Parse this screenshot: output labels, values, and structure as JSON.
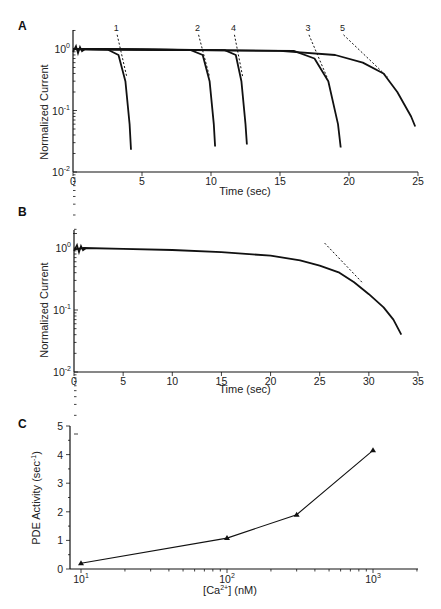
{
  "chart_data": [
    {
      "panel": "A",
      "type": "line",
      "xlabel": "Time (sec)",
      "ylabel": "Normalized Current",
      "xlim": [
        0,
        25
      ],
      "ylim": [
        0.01,
        2
      ],
      "yscale": "log",
      "xticks": [
        "0",
        "5",
        "10",
        "15",
        "20",
        "25"
      ],
      "yticks": [
        "10^0",
        "10^-1",
        "10^-2"
      ],
      "annotations": [
        "1",
        "2",
        "4",
        "3",
        "5"
      ],
      "series": [
        {
          "name": "1",
          "x": [
            0,
            2.5,
            3.3,
            3.8,
            4.1,
            4.2
          ],
          "y": [
            1.0,
            0.98,
            0.8,
            0.3,
            0.06,
            0.023
          ]
        },
        {
          "name": "2",
          "x": [
            0,
            8.5,
            9.4,
            9.9,
            10.2,
            10.3
          ],
          "y": [
            1.0,
            0.97,
            0.8,
            0.3,
            0.06,
            0.026
          ]
        },
        {
          "name": "4",
          "x": [
            0,
            11,
            11.8,
            12.2,
            12.5,
            12.6
          ],
          "y": [
            1.0,
            0.96,
            0.8,
            0.3,
            0.06,
            0.028
          ]
        },
        {
          "name": "3",
          "x": [
            0,
            16,
            17.5,
            18.5,
            19.2,
            19.4
          ],
          "y": [
            1.0,
            0.93,
            0.7,
            0.3,
            0.06,
            0.025
          ]
        },
        {
          "name": "5",
          "x": [
            0,
            15,
            19,
            21,
            22.5,
            23.5,
            24.5,
            24.8
          ],
          "y": [
            1.0,
            0.93,
            0.8,
            0.6,
            0.4,
            0.2,
            0.08,
            0.055
          ]
        }
      ],
      "fit_lines": [
        {
          "name": "1",
          "x": [
            3.2,
            3.9
          ],
          "y": [
            1.7,
            0.35
          ]
        },
        {
          "name": "2",
          "x": [
            9.1,
            9.9
          ],
          "y": [
            1.7,
            0.35
          ]
        },
        {
          "name": "4",
          "x": [
            11.7,
            12.3
          ],
          "y": [
            1.7,
            0.35
          ]
        },
        {
          "name": "3",
          "x": [
            17.1,
            18.4
          ],
          "y": [
            1.7,
            0.35
          ]
        },
        {
          "name": "5",
          "x": [
            19.6,
            22.8
          ],
          "y": [
            1.7,
            0.35
          ]
        }
      ]
    },
    {
      "panel": "B",
      "type": "line",
      "xlabel": "Time (sec)",
      "ylabel": "Normalized Current",
      "xlim": [
        0,
        35
      ],
      "ylim": [
        0.01,
        2
      ],
      "yscale": "log",
      "xticks": [
        "0",
        "5",
        "10",
        "15",
        "20",
        "25",
        "30",
        "35"
      ],
      "yticks": [
        "10^0",
        "10^-1",
        "10^-2"
      ],
      "series": [
        {
          "name": "trace",
          "x": [
            0,
            1,
            5,
            10,
            15,
            20,
            23,
            25,
            27,
            28.5,
            30,
            31.5,
            32.5,
            33.3
          ],
          "y": [
            0.95,
            1.0,
            0.97,
            0.93,
            0.86,
            0.75,
            0.63,
            0.52,
            0.4,
            0.28,
            0.18,
            0.11,
            0.07,
            0.04
          ]
        }
      ],
      "fit_lines": [
        {
          "name": "fit",
          "x": [
            25.5,
            29.3
          ],
          "y": [
            1.2,
            0.28
          ]
        }
      ]
    },
    {
      "panel": "C",
      "type": "line",
      "xlabel": "[Ca2+] (nM)",
      "ylabel": "PDE Activity (sec-1)",
      "xscale": "log",
      "xlim": [
        8,
        2000
      ],
      "ylim": [
        0,
        5
      ],
      "xticks": [
        "10^1",
        "10^2",
        "10^3"
      ],
      "yticks": [
        "0",
        "1",
        "2",
        "3",
        "4",
        "5"
      ],
      "marker": "triangle",
      "x": [
        10,
        100,
        300,
        1000
      ],
      "y": [
        0.2,
        1.08,
        1.9,
        4.15
      ]
    }
  ],
  "labels": {
    "panel_a": "A",
    "panel_b": "B",
    "panel_c": "C",
    "time_label": "Time (sec)",
    "current_label": "Normalized Current",
    "pde_label": "PDE Activity (sec",
    "pde_sup": "-1",
    "pde_close": ")",
    "ca_label_open": "[Ca",
    "ca_sup": "2+",
    "ca_label_close": "] (nM)"
  }
}
